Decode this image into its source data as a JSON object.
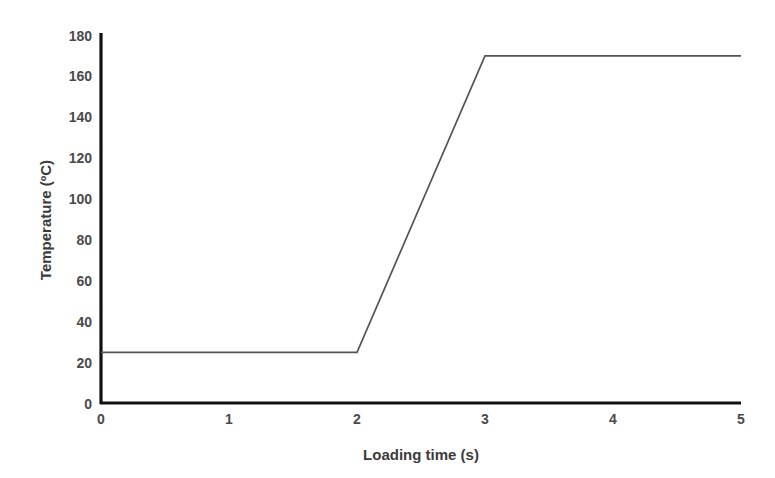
{
  "chart_data": {
    "type": "line",
    "title": "",
    "xlabel": "Loading time (s)",
    "ylabel": "Temperature (ºC)",
    "xlim": [
      0,
      5
    ],
    "ylim": [
      0,
      180
    ],
    "xticks": [
      0,
      1,
      2,
      3,
      4,
      5
    ],
    "yticks": [
      0,
      20,
      40,
      60,
      80,
      100,
      120,
      140,
      160,
      180
    ],
    "xtick_labels": [
      "0",
      "1",
      "2",
      "3",
      "4",
      "5"
    ],
    "ytick_labels": [
      "0",
      "20",
      "40",
      "60",
      "80",
      "100",
      "120",
      "140",
      "160",
      "180"
    ],
    "grid": false,
    "legend": null,
    "series": [
      {
        "name": "Temperature profile",
        "x": [
          0,
          2,
          3,
          5
        ],
        "values": [
          25,
          25,
          170,
          170
        ],
        "color": "#555555"
      }
    ],
    "annotations": [],
    "axis_color": "#1a1a1a",
    "text_color": "#3b3b3b"
  },
  "axis_titles": {
    "x": "Loading time (s)",
    "y": "Temperature (ºC)"
  }
}
